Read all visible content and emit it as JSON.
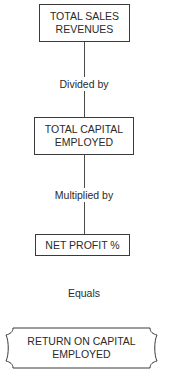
{
  "diagram": {
    "type": "flowchart",
    "nodes": [
      {
        "id": "n1",
        "label_line1": "TOTAL SALES",
        "label_line2": "REVENUES",
        "shape": "rectangle"
      },
      {
        "id": "n2",
        "label_line1": "TOTAL CAPITAL",
        "label_line2": "EMPLOYED",
        "shape": "rectangle"
      },
      {
        "id": "n3",
        "label_line1": "NET PROFIT %",
        "shape": "rectangle"
      },
      {
        "id": "n4",
        "label_line1": "RETURN ON CAPITAL",
        "label_line2": "EMPLOYED",
        "shape": "scroll-banner"
      }
    ],
    "edges": [
      {
        "from": "n1",
        "to": "n2",
        "label": "Divided by"
      },
      {
        "from": "n2",
        "to": "n3",
        "label": "Multiplied by"
      },
      {
        "from": "n3",
        "to": "n4",
        "label": "Equals"
      }
    ]
  },
  "colors": {
    "stroke": "#3a3a3a",
    "text": "#2a2a2a",
    "background": "#ffffff"
  }
}
